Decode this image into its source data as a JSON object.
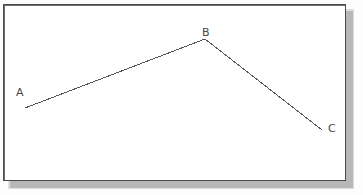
{
  "figure": {
    "kind": "geometry-line-diagram",
    "background_color": "#ffffff",
    "frame": {
      "name": "figure-border",
      "border_color": "#4a4a4a",
      "border_width_px": 1,
      "shadow_color": "#a9a9a9",
      "x": 3,
      "y": 4,
      "width": 343,
      "height": 177
    },
    "stroke": {
      "color": "#555555",
      "width_px": 1
    },
    "points": [
      {
        "id": "A",
        "label": "A",
        "x": 25,
        "y": 108,
        "label_x": 16,
        "label_y": 87
      },
      {
        "id": "B",
        "label": "B",
        "x": 205,
        "y": 39,
        "label_x": 202,
        "label_y": 27
      },
      {
        "id": "C",
        "label": "C",
        "x": 322,
        "y": 130,
        "label_x": 328,
        "label_y": 123
      }
    ],
    "segments": [
      {
        "id": "AB",
        "from": "A",
        "to": "B"
      },
      {
        "id": "BC",
        "from": "B",
        "to": "C"
      }
    ],
    "polyline_points": "25,108 205,39 322,130"
  },
  "chart_data": {
    "type": "line",
    "title": "",
    "xlabel": "",
    "ylabel": "",
    "series": [
      {
        "name": "ABC",
        "point_labels": [
          "A",
          "B",
          "C"
        ],
        "x": [
          25,
          205,
          322
        ],
        "y": [
          108,
          39,
          130
        ]
      }
    ],
    "grid": false,
    "legend": "none",
    "annotations": [
      "A",
      "B",
      "C"
    ]
  }
}
